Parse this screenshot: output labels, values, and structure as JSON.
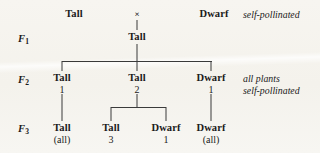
{
  "diagram": {
    "background_color": "#f6f4ef",
    "line_color": "#3a3a3a",
    "generations": [
      {
        "id": "p",
        "label": "",
        "sub": ""
      },
      {
        "id": "f1",
        "label": "F",
        "sub": "1"
      },
      {
        "id": "f2",
        "label": "F",
        "sub": "2"
      },
      {
        "id": "f3",
        "label": "F",
        "sub": "3"
      }
    ],
    "cross_symbol": "×",
    "parental": {
      "left": "Tall",
      "right": "Dwarf",
      "note": "self-pollinated"
    },
    "f1": {
      "center": "Tall"
    },
    "f2": {
      "note_line1": "all plants",
      "note_line2": "self-pollinated",
      "nodes": [
        {
          "label": "Tall",
          "count": "1"
        },
        {
          "label": "Tall",
          "count": "2"
        },
        {
          "label": "Dwarf",
          "count": "1"
        }
      ]
    },
    "f3": {
      "nodes": [
        {
          "label": "Tall",
          "count": "(all)"
        },
        {
          "label": "Tall",
          "count": "3"
        },
        {
          "label": "Dwarf",
          "count": "1"
        },
        {
          "label": "Dwarf",
          "count": "(all)"
        }
      ]
    }
  }
}
